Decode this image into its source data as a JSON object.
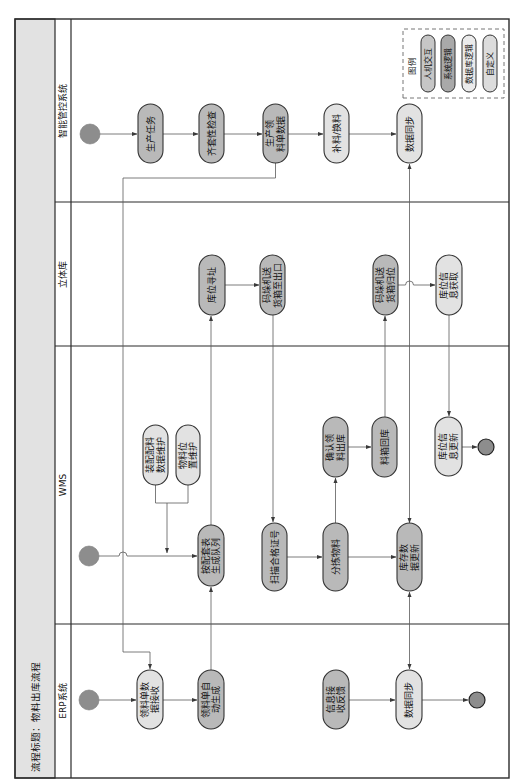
{
  "title": "流程标题：物料出库流程",
  "colors": {
    "dark": "#b9b9b9",
    "light": "#e2e2e2",
    "title_bg": "#e2e2e2",
    "start": "#8d8d8d",
    "end": "#8d8d8d",
    "line": "#2b2b2b"
  },
  "lanes": [
    {
      "label": "ERP系统",
      "nodes": [
        {
          "text": "领料单数据接收",
          "lines": [
            "领料单数",
            "据接收"
          ],
          "style": "light"
        },
        {
          "text": "领料单自动生成",
          "lines": [
            "领料单自",
            "动生成"
          ],
          "style": "dark"
        },
        {
          "text": "信息接收反馈",
          "lines": [
            "信息接",
            "收反馈"
          ],
          "style": "dark"
        },
        {
          "text": "数据同步",
          "lines": [
            "数据同步"
          ],
          "style": "light"
        }
      ]
    },
    {
      "label": "WMS",
      "nodes": [
        {
          "text": "装配配料数据维护",
          "lines": [
            "装配配料",
            "数据维护"
          ],
          "style": "light"
        },
        {
          "text": "物料位置维护",
          "lines": [
            "物料位",
            "置维护"
          ],
          "style": "light"
        },
        {
          "text": "按配套表生成队列",
          "lines": [
            "按配套表",
            "生成队列"
          ],
          "style": "dark"
        },
        {
          "text": "扫描合格证号",
          "lines": [
            "扫描合格证号"
          ],
          "style": "dark"
        },
        {
          "text": "分拣物料",
          "lines": [
            "分拣物料"
          ],
          "style": "dark"
        },
        {
          "text": "确认领料出库",
          "lines": [
            "确认领",
            "料出库"
          ],
          "style": "dark"
        },
        {
          "text": "料箱回库",
          "lines": [
            "料箱回库"
          ],
          "style": "dark"
        },
        {
          "text": "库存数据更新",
          "lines": [
            "库存数",
            "据更新"
          ],
          "style": "dark"
        },
        {
          "text": "库位信息更新",
          "lines": [
            "库位信",
            "息更新"
          ],
          "style": "light"
        }
      ]
    },
    {
      "label": "立体库",
      "nodes": [
        {
          "text": "库位寻址",
          "lines": [
            "库位寻址"
          ],
          "style": "dark"
        },
        {
          "text": "码垛机送货箱至出口",
          "lines": [
            "码垛机送",
            "货箱至出口"
          ],
          "style": "dark"
        },
        {
          "text": "码垛机送货箱归位",
          "lines": [
            "码垛机送",
            "货箱归位"
          ],
          "style": "dark"
        },
        {
          "text": "库位信息获取",
          "lines": [
            "库位信",
            "息获取"
          ],
          "style": "light"
        }
      ]
    },
    {
      "label": "智能管控系统",
      "nodes": [
        {
          "text": "生产任务",
          "lines": [
            "生产任务"
          ],
          "style": "dark"
        },
        {
          "text": "齐套性检查",
          "lines": [
            "齐套性检查"
          ],
          "style": "dark"
        },
        {
          "text": "生产领料单数据",
          "lines": [
            "生产领",
            "料单数据"
          ],
          "style": "dark"
        },
        {
          "text": "补料/换料",
          "lines": [
            "补料/换料"
          ],
          "style": "light"
        },
        {
          "text": "数据同步",
          "lines": [
            "数据同步"
          ],
          "style": "light"
        }
      ]
    }
  ],
  "legend": {
    "label": "图例",
    "items": [
      {
        "label": "人机交互",
        "color": "#c6c6c6"
      },
      {
        "label": "系统逻辑",
        "color": "#a9a9a9"
      },
      {
        "label": "数据库逻辑",
        "color": "#ebebeb"
      },
      {
        "label": "自定义",
        "color": "#dcdcdc"
      }
    ]
  },
  "edges": [
    {
      "from": "start:ERP系统",
      "to": "领料单数据接收"
    },
    {
      "from": "领料单数据接收",
      "to": "领料单自动生成"
    },
    {
      "from": "领料单自动生成",
      "to": "按配套表生成队列"
    },
    {
      "from": "生产领料单数据",
      "to": "领料单数据接收"
    },
    {
      "from": "信息接收反馈",
      "to": "数据同步@ERP系统"
    },
    {
      "from": "数据同步@ERP系统",
      "to": "end:ERP系统"
    },
    {
      "from": "库存数据更新",
      "to": "数据同步@ERP系统",
      "bidirectional": true
    },
    {
      "from": "start:WMS",
      "to": "按配套表生成队列"
    },
    {
      "from": "装配配料数据维护",
      "to": "按配套表生成队列"
    },
    {
      "from": "物料位置维护",
      "to": "按配套表生成队列"
    },
    {
      "from": "按配套表生成队列",
      "to": "库位寻址"
    },
    {
      "from": "库位寻址",
      "to": "码垛机送货箱至出口"
    },
    {
      "from": "码垛机送货箱至出口",
      "to": "扫描合格证号"
    },
    {
      "from": "扫描合格证号",
      "to": "分拣物料"
    },
    {
      "from": "分拣物料",
      "to": "库存数据更新"
    },
    {
      "from": "分拣物料",
      "to": "确认领料出库"
    },
    {
      "from": "确认领料出库",
      "to": "料箱回库"
    },
    {
      "from": "料箱回库",
      "to": "码垛机送货箱归位"
    },
    {
      "from": "码垛机送货箱归位",
      "to": "库位信息获取"
    },
    {
      "from": "库位信息获取",
      "to": "库位信息更新"
    },
    {
      "from": "库位信息更新",
      "to": "end:WMS"
    },
    {
      "from": "库存数据更新",
      "to": "数据同步@智能管控系统",
      "bidirectional": true
    },
    {
      "from": "start:智能管控系统",
      "to": "生产任务"
    },
    {
      "from": "生产任务",
      "to": "齐套性检查"
    },
    {
      "from": "齐套性检查",
      "to": "生产领料单数据"
    },
    {
      "from": "生产领料单数据",
      "to": "补料/换料"
    },
    {
      "from": "补料/换料",
      "to": "数据同步@智能管控系统"
    }
  ]
}
